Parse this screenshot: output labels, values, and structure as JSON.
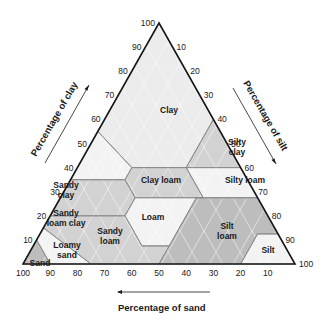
{
  "geometry": {
    "apex": [
      159,
      23
    ],
    "bottom_left": [
      23,
      264
    ],
    "bottom_right": [
      295,
      264
    ]
  },
  "colors": {
    "outline": "#1a1a1a",
    "boundary": "#8a8a8a",
    "light": "#ececec",
    "lighter": "#f3f3f3",
    "medium": "#d2d2d2",
    "dark": "#bdbdbd",
    "hatch": "#ffffff"
  },
  "axes": {
    "clay": {
      "title": "Percentage of clay",
      "ticks": [
        "10",
        "20",
        "30",
        "40",
        "50",
        "60",
        "70",
        "80",
        "90",
        "100"
      ]
    },
    "silt": {
      "title": "Percentage of silt",
      "ticks": [
        "10",
        "20",
        "30",
        "40",
        "50",
        "60",
        "70",
        "80",
        "90",
        "100"
      ]
    },
    "sand": {
      "title": "Percentage of sand",
      "ticks": [
        "100",
        "90",
        "80",
        "70",
        "60",
        "50",
        "40",
        "30",
        "20",
        "10"
      ]
    }
  },
  "regions": [
    {
      "name": "Clay",
      "shade": "light",
      "points": [
        [
          100,
          0
        ],
        [
          40,
          0
        ],
        [
          40,
          15
        ],
        [
          45,
          15
        ],
        [
          55,
          0
        ],
        [
          60,
          40
        ],
        [
          40,
          40
        ]
      ],
      "label": [
        "Clay"
      ],
      "label_pos": [
        169,
        110
      ]
    },
    {
      "name": "Sandy clay",
      "shade": "lighter",
      "label": [
        "Sandy",
        "clay"
      ],
      "label_pos": [
        66,
        190
      ]
    },
    {
      "name": "Silty clay",
      "shade": "medium",
      "label": [
        "Silty",
        "clay"
      ],
      "label_pos": [
        237,
        147
      ]
    },
    {
      "name": "Sandy loam clay",
      "shade": "medium",
      "label": [
        "Sandy",
        "loam clay"
      ],
      "label_pos": [
        66,
        218
      ]
    },
    {
      "name": "Clay loam",
      "shade": "medium",
      "label": [
        "Clay loam"
      ],
      "label_pos": [
        161,
        180
      ]
    },
    {
      "name": "Silty loam",
      "shade": "lighter",
      "label": [
        "Silty loam"
      ],
      "label_pos": [
        245,
        180
      ]
    },
    {
      "name": "Loam",
      "shade": "lighter",
      "label": [
        "Loam"
      ],
      "label_pos": [
        153,
        217
      ]
    },
    {
      "name": "Sandy loam",
      "shade": "medium",
      "label": [
        "Sandy",
        "loam"
      ],
      "label_pos": [
        110,
        236
      ]
    },
    {
      "name": "Silt loam",
      "shade": "dark",
      "label": [
        "Silt",
        "loam"
      ],
      "label_pos": [
        227,
        231
      ]
    },
    {
      "name": "Loamy sand",
      "shade": "lighter",
      "label": [
        "Loamy",
        "sand"
      ],
      "label_pos": [
        67,
        250
      ]
    },
    {
      "name": "Sand",
      "shade": "dark",
      "label": [
        "Sand"
      ],
      "label_pos": [
        40,
        263
      ]
    },
    {
      "name": "Silt",
      "shade": "lighter",
      "label": [
        "Silt"
      ],
      "label_pos": [
        268,
        250
      ]
    }
  ]
}
